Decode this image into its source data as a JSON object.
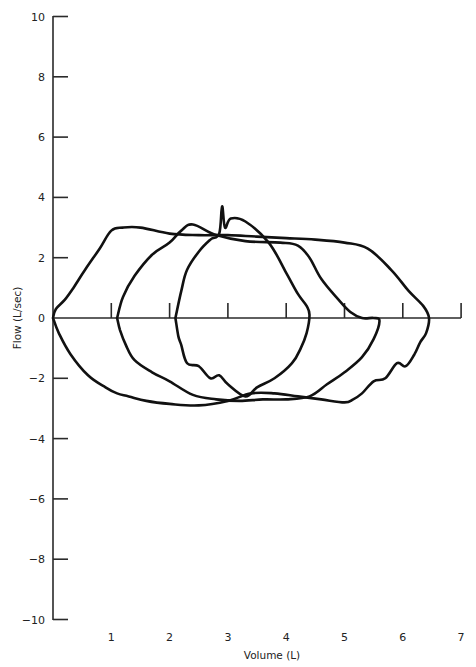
{
  "chart_data": {
    "type": "line",
    "title": "",
    "xlabel": "Volume (L)",
    "ylabel": "Flow (L/sec)",
    "xlim": [
      0,
      7
    ],
    "ylim": [
      -10,
      10
    ],
    "x_ticks": [
      "1",
      "2",
      "3",
      "4",
      "5",
      "6",
      "7"
    ],
    "y_ticks": [
      "10",
      "8",
      "6",
      "4",
      "2",
      "0",
      "-2",
      "-4",
      "-6",
      "-8",
      "-10"
    ],
    "grid": false,
    "legend": null,
    "series": [
      {
        "name": "Large flow-volume loop",
        "x": [
          0.0,
          0.05,
          0.2,
          0.35,
          0.55,
          0.8,
          1.0,
          1.2,
          1.5,
          2.0,
          2.5,
          3.0,
          3.5,
          4.0,
          4.5,
          5.0,
          5.4,
          5.8,
          6.1,
          6.35,
          6.45,
          6.4,
          6.3,
          6.2,
          6.05,
          5.9,
          5.7,
          5.5,
          5.3,
          5.15,
          5.0,
          4.6,
          4.2,
          3.8,
          3.4,
          3.0,
          2.5,
          2.0,
          1.6,
          1.3,
          1.1,
          0.9,
          0.6,
          0.3,
          0.1,
          0.0
        ],
        "y": [
          0.0,
          0.3,
          0.6,
          1.0,
          1.6,
          2.3,
          2.9,
          3.0,
          3.0,
          2.8,
          2.75,
          2.75,
          2.7,
          2.65,
          2.6,
          2.5,
          2.3,
          1.6,
          0.9,
          0.4,
          0.0,
          -0.5,
          -0.8,
          -1.2,
          -1.6,
          -1.5,
          -2.0,
          -2.1,
          -2.5,
          -2.7,
          -2.8,
          -2.7,
          -2.6,
          -2.5,
          -2.5,
          -2.75,
          -2.9,
          -2.85,
          -2.75,
          -2.6,
          -2.5,
          -2.3,
          -1.9,
          -1.2,
          -0.5,
          0.0
        ]
      },
      {
        "name": "Medium flow-volume loop",
        "x": [
          1.1,
          1.2,
          1.4,
          1.7,
          2.0,
          2.2,
          2.4,
          2.8,
          3.3,
          3.9,
          4.2,
          4.4,
          4.6,
          4.9,
          5.1,
          5.3,
          5.5,
          5.6,
          5.5,
          5.3,
          5.0,
          4.7,
          4.4,
          4.0,
          3.6,
          3.2,
          2.8,
          2.4,
          2.0,
          1.7,
          1.4,
          1.25,
          1.15,
          1.1
        ],
        "y": [
          0.0,
          0.7,
          1.4,
          2.1,
          2.5,
          2.9,
          3.1,
          2.75,
          2.55,
          2.5,
          2.4,
          2.0,
          1.3,
          0.6,
          0.2,
          0.0,
          0.0,
          -0.1,
          -0.7,
          -1.3,
          -1.8,
          -2.2,
          -2.6,
          -2.7,
          -2.7,
          -2.75,
          -2.7,
          -2.55,
          -2.1,
          -1.8,
          -1.4,
          -0.9,
          -0.4,
          0.0
        ]
      },
      {
        "name": "Small flow-volume loop",
        "x": [
          2.1,
          2.2,
          2.3,
          2.5,
          2.7,
          2.85,
          2.9,
          2.95,
          3.05,
          3.3,
          3.7,
          4.0,
          4.2,
          4.35,
          4.4,
          4.35,
          4.25,
          4.1,
          3.8,
          3.5,
          3.3,
          3.0,
          2.85,
          2.7,
          2.5,
          2.3,
          2.2,
          2.15,
          2.1
        ],
        "y": [
          0.0,
          0.9,
          1.6,
          2.2,
          2.6,
          2.8,
          3.7,
          3.0,
          3.3,
          3.2,
          2.5,
          1.5,
          0.8,
          0.4,
          0.1,
          -0.5,
          -1.0,
          -1.5,
          -2.0,
          -2.3,
          -2.6,
          -2.2,
          -1.9,
          -2.0,
          -1.6,
          -1.5,
          -0.9,
          -0.6,
          0.0
        ]
      }
    ]
  },
  "axes": {
    "x_title": "Volume (L)",
    "y_title": "Flow (L/sec)"
  }
}
